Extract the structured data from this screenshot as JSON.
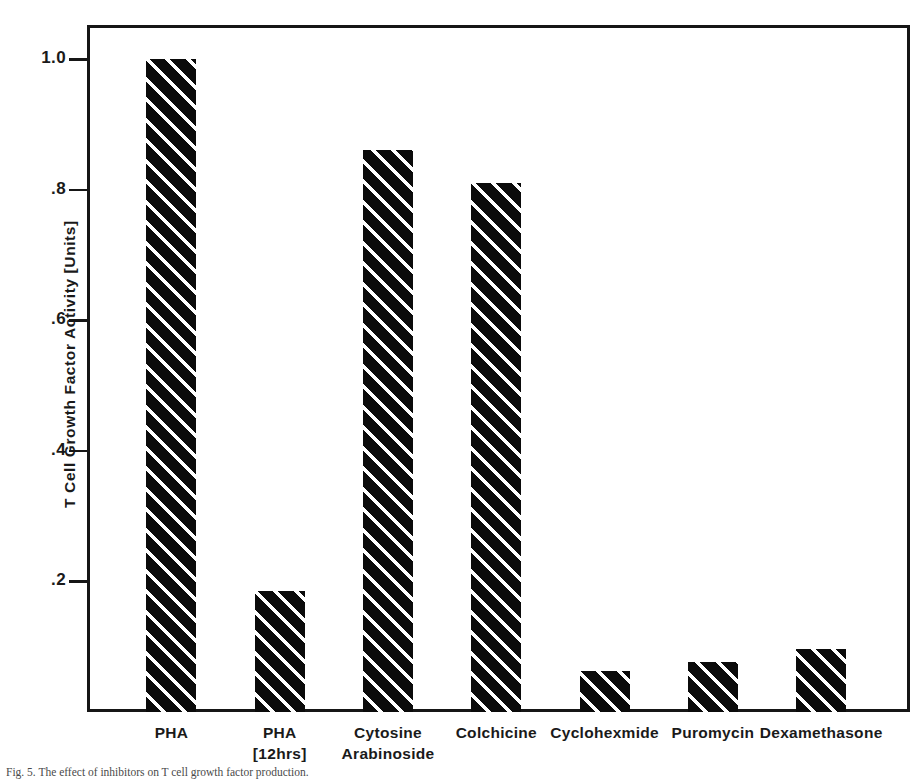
{
  "figure": {
    "caption": "Fig. 5. The effect of inhibitors on T cell growth factor production."
  },
  "chart_data": {
    "type": "bar",
    "title": "",
    "xlabel": "",
    "ylabel": "T Cell Growth Factor Activity [Units]",
    "ylim": [
      0,
      1.08
    ],
    "ytick_values": [
      0.2,
      0.4,
      0.6,
      0.8,
      1.0
    ],
    "ytick_labels": [
      ".2",
      ".4",
      ".6",
      ".8",
      "1.0"
    ],
    "grid": false,
    "legend": null,
    "bar_style": {
      "fill": "#0b0b0b",
      "hatch": "diagonal-stripes",
      "hatch_color": "#ffffff"
    },
    "categories": [
      "PHA",
      "PHA [12hrs]",
      "Cytosine Arabinoside",
      "Colchicine",
      "Cyclohexmide",
      "Puromycin",
      "Dexamethasone"
    ],
    "category_lines": [
      [
        "PHA",
        ""
      ],
      [
        "PHA",
        "[12hrs]"
      ],
      [
        "Cytosine",
        "Arabinoside"
      ],
      [
        "Colchicine",
        ""
      ],
      [
        "Cyclohexmide",
        ""
      ],
      [
        "Puromycin",
        ""
      ],
      [
        "Dexamethasone",
        ""
      ]
    ],
    "values": [
      1.0,
      0.185,
      0.86,
      0.81,
      0.063,
      0.077,
      0.097
    ]
  }
}
